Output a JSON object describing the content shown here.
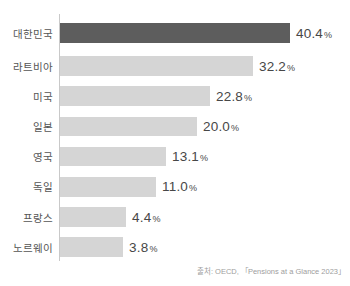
{
  "chart_data": {
    "type": "bar",
    "orientation": "horizontal",
    "title": "",
    "categories": [
      "대한민국",
      "라트비아",
      "미국",
      "일본",
      "영국",
      "독일",
      "프랑스",
      "노르웨이"
    ],
    "values": [
      40.4,
      32.2,
      22.8,
      20.0,
      13.1,
      11.0,
      4.4,
      3.8
    ],
    "value_labels": [
      "40.4",
      "32.2",
      "22.8",
      "20.0",
      "13.1",
      "11.0",
      "4.4",
      "3.8"
    ],
    "unit": "%",
    "highlight_index": 0,
    "legend": "none",
    "grid": false,
    "colors": {
      "highlight_bar": "#5d5d5d",
      "bar": "#d5d5d5",
      "axis": "#c9c9c9",
      "category_label": "#555555",
      "value_label": "#474747",
      "source_text": "#9e9e9e"
    },
    "bar_scale": {
      "base_px": 46,
      "px_per_unit": 4.55
    },
    "source": "출처: OECD, 「Pensions at a Glance 2023」"
  }
}
